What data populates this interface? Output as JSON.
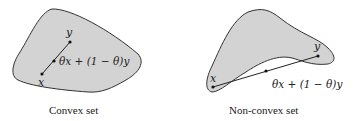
{
  "figures": [
    {
      "caption": "Convex set",
      "point_x_label": "x",
      "point_y_label": "y",
      "combination_label": "θx + (1 − θ)y"
    },
    {
      "caption": "Non-convex set",
      "point_x_label": "x",
      "point_y_label": "y",
      "combination_label": "θx + (1 − θ)y"
    }
  ],
  "colors": {
    "fill": "#d3d3d3",
    "stroke": "#333333",
    "background": "#ffffff"
  }
}
